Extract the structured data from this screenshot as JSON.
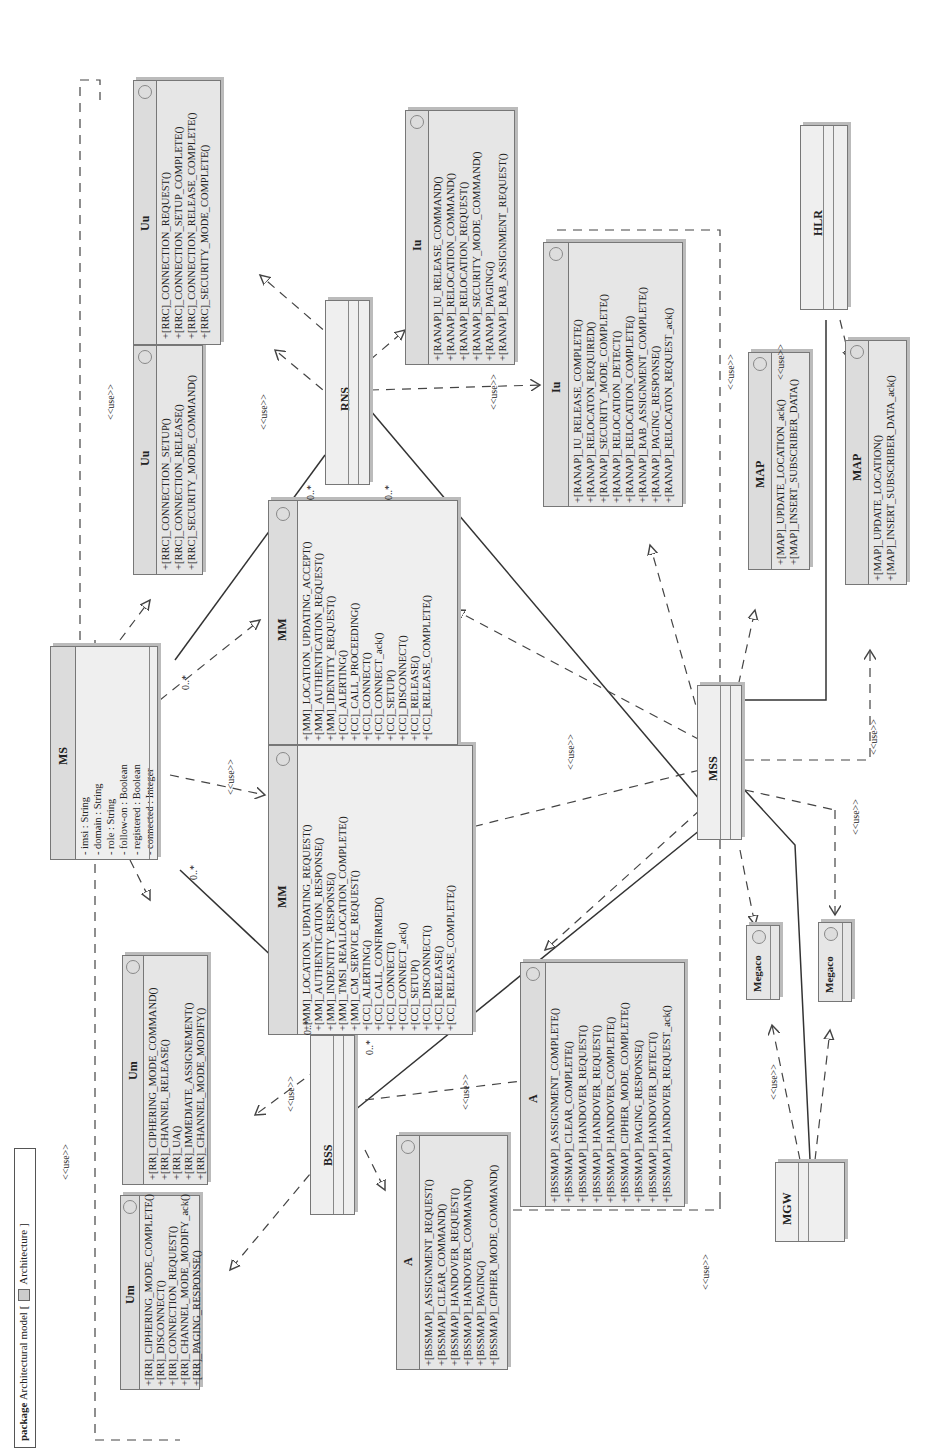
{
  "package": {
    "keyword": "package",
    "name": "Architectural model [",
    "icon": "package-diagram-icon",
    "diagram": "Architecture ]"
  },
  "figure_label": "",
  "nodes": {
    "MS": {
      "name": "MS",
      "attributes": [
        "- imsi : String",
        "- domain : String",
        "- role : String",
        "- follow-on : Boolean",
        "- registered : Boolean",
        "- connected : Integer"
      ]
    },
    "BSS": {
      "name": "BSS"
    },
    "RNS": {
      "name": "RNS"
    },
    "MSS": {
      "name": "MSS"
    },
    "HLR": {
      "name": "HLR"
    },
    "MGW": {
      "name": "MGW"
    }
  },
  "interfaces": {
    "um1": {
      "name": "Um",
      "ops": [
        "+[RR]_CIPHERING_MODE_COMPLETE()",
        "+[RR]_DISCONNECT()",
        "+[RR]_CONNECTION_REQUEST()",
        "+[RR]_CHANNEL_MODE_MODIFY_ack()",
        "+[RR]_PAGING_RESPONSE()"
      ]
    },
    "um2": {
      "name": "Um",
      "ops": [
        "+[RR]_CIPHERING_MODE_COMMAND()",
        "+[RR]_CHANNEL_RELEASE()",
        "+[RR]_UA()",
        "+[RR]_IMMEDIATE_ASSIGNEMENT()",
        "+[RR]_CHANNEL_MODE_MODIFY()"
      ]
    },
    "uu1": {
      "name": "Uu",
      "ops": [
        "+[RRC]_CONNECTION_SETUP()",
        "+[RRC]_CONNECTION_RELEASE()",
        "+[RRC]_SECURITY_MODE_COMMAND()"
      ]
    },
    "uu2": {
      "name": "Uu",
      "ops": [
        "+[RRC]_CONNECTION_REQUEST()",
        "+[RRC]_CONNECTION_SETUP_COMPLETE()",
        "+[RRC]_CONNECTION_RELEASE_COMPLETE()",
        "+[RRC]_SECURITY_MODE_COMPLETE()"
      ]
    },
    "mm1": {
      "name": "MM",
      "ops": [
        "+[MM]_LOCATION_UPDATING_REQUEST()",
        "+[MM]_AUTHENTICATION_RESPONSE()",
        "+[MM]_INDENTITY_RESPONSE()",
        "+[MM]_TMSI_REALLOCATION_COMPLETE()",
        "+[MM]_CM_SERVICE_REQUEST()",
        "+[CC]_ALERTING()",
        "+[CC]_CALL_CONFIRMED()",
        "+[CC]_CONNECT()",
        "+[CC]_CONNECT_ack()",
        "+[CC]_SETUP()",
        "+[CC]_DISCONNECT()",
        "+[CC]_RELEASE()",
        "+[CC]_RELEASE_COMPLETE()"
      ]
    },
    "mm2": {
      "name": "MM",
      "ops": [
        "+[MM]_LOCATION_UPDATING_ACCEPT()",
        "+[MM]_AUTHENTICATION_REQUEST()",
        "+[MM]_IDENTITY_REQUEST()",
        "+[CC]_ALERTING()",
        "+[CC]_CALL_PROCEEDING()",
        "+[CC]_CONNECT()",
        "+[CC]_CONNECT_ack()",
        "+[CC]_SETUP()",
        "+[CC]_DISCONNECT()",
        "+[CC]_RELEASE()",
        "+[CC]_RELEASE_COMPLETE()"
      ]
    },
    "iu1": {
      "name": "Iu",
      "ops": [
        "+[RANAP]_IU_RELEASE_COMMAND()",
        "+[RANAP]_RELOCATION_COMMAND()",
        "+[RANAP]_RELOCATION_REQUEST()",
        "+[RANAP]_SECURITY_MODE_COMMAND()",
        "+[RANAP]_PAGING()",
        "+[RANAP]_RAB_ASSIGNMENT_REQUEST()"
      ]
    },
    "iu2": {
      "name": "Iu",
      "ops": [
        "+[RANAP]_IU_RELEASE_COMPLETE()",
        "+[RANAP]_RELOCATON_REQUIRED()",
        "+[RANAP]_SECURITY_MODE_COMPLETE()",
        "+[RANAP]_RELOCATION_DETECT()",
        "+[RANAP]_RELOCATION_COMPLETE()",
        "+[RANAP]_RAB_ASSIGNMENT_COMPLETE()",
        "+[RANAP]_PAGING_RESPONSE()",
        "+[RANAP]_RELOCATON_REQUEST_ack()"
      ]
    },
    "a1": {
      "name": "A",
      "ops": [
        "+[BSSMAP]_ASSIGNMENT_REQUEST()",
        "+[BSSMAP]_CLEAR_COMMAND()",
        "+[BSSMAP]_HANDOVER_REQUEST()",
        "+[BSSMAP]_HANDOVER_COMMAND()",
        "+[BSSMAP]_PAGING()",
        "+[BSSMAP]_CIPHER_MODE_COMMAND()"
      ]
    },
    "a2": {
      "name": "A",
      "ops": [
        "+[BSSMAP]_ASSIGNMENT_COMPLETE()",
        "+[BSSMAP]_CLEAR_COMPLETE()",
        "+[BSSMAP]_HANDOVER_REQUEST()",
        "+[BSSMAP]_HANDOVER_REQUEST()",
        "+[BSSMAP]_HANDOVER_COMPLETE()",
        "+[BSSMAP]_CIPHER_MODE_COMPLETE()",
        "+[BSSMAP]_PAGING_RESPONSE()",
        "+[BSSMAP]_HANDOVER_DETECT()",
        "+[BSSMAP]_HANDOVER_REQUEST_ack()"
      ]
    },
    "map1": {
      "name": "MAP",
      "ops": [
        "+[MAP]_UPDATE_LOCATION_ack()",
        "+[MAP]_INSERT_SUBSCRIBER_DATA()"
      ]
    },
    "map2": {
      "name": "MAP",
      "ops": [
        "+[MAP]_UPDATE_LOCATION()",
        "+[MAP]_INSERT_SUBSCRIBER_DATA_ack()"
      ]
    },
    "megaco1": {
      "name": "Megaco"
    },
    "megaco2": {
      "name": "Megaco"
    }
  },
  "labels": {
    "use": "<<use>>",
    "many": "0..*",
    "one": "1"
  }
}
